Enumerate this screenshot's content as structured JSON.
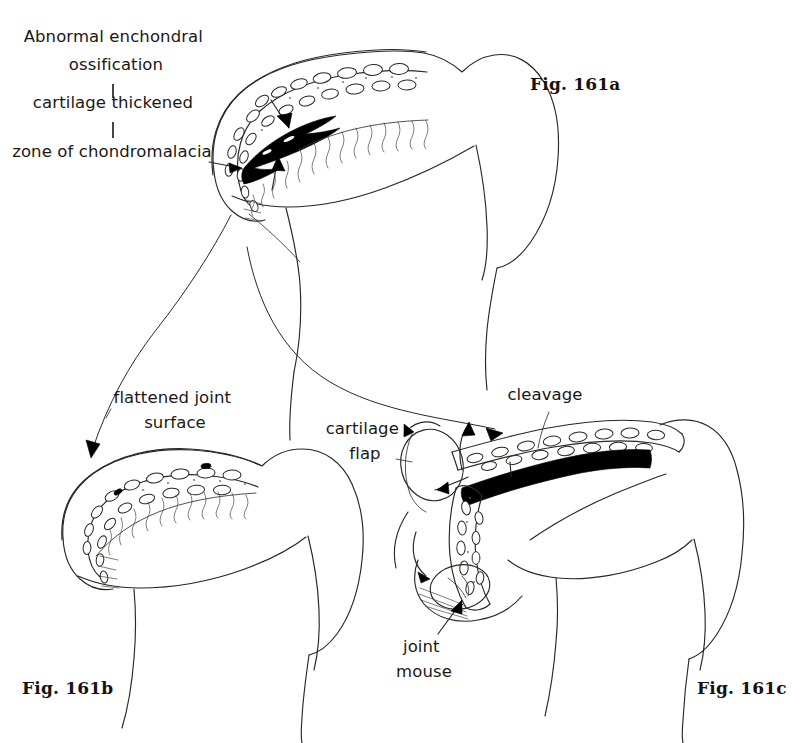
{
  "document": {
    "kind": "medical-illustration",
    "subject": "Osteochondritis dissecans / chondromalacia of the femoral head",
    "background_color": "#ffffff",
    "ink_color": "#2b2621",
    "necrosis_color": "#000000"
  },
  "figures": [
    {
      "id": "fig-161a",
      "caption": "Fig. 161a",
      "caption_x": 530,
      "caption_y": 90
    },
    {
      "id": "fig-161b",
      "caption": "Fig. 161b",
      "caption_x": 22,
      "caption_y": 694
    },
    {
      "id": "fig-161c",
      "caption": "Fig. 161c",
      "caption_x": 697,
      "caption_y": 694
    }
  ],
  "annotations": [
    {
      "id": "abnormal-enchondral-ossification",
      "lines": [
        "Abnormal enchondral",
        "ossification"
      ],
      "anchor_x": 116,
      "anchor_y": 42,
      "align": "middle"
    },
    {
      "id": "cartilage-thickened",
      "lines": [
        "cartilage thickened"
      ],
      "anchor_x": 113,
      "anchor_y": 108,
      "align": "middle"
    },
    {
      "id": "zone-of-chondromalacia",
      "lines": [
        "zone of chondromalacia"
      ],
      "anchor_x": 112,
      "anchor_y": 157,
      "align": "middle"
    },
    {
      "id": "flattened-joint-surface",
      "lines": [
        "flattened joint",
        "surface"
      ],
      "anchor_x": 175,
      "anchor_y": 403,
      "align": "middle"
    },
    {
      "id": "cartilage-flap",
      "lines": [
        "cartilage",
        "flap"
      ],
      "anchor_x": 365,
      "anchor_y": 434,
      "align": "middle"
    },
    {
      "id": "cleavage",
      "lines": [
        "cleavage"
      ],
      "anchor_x": 545,
      "anchor_y": 400,
      "align": "middle"
    },
    {
      "id": "joint-mouse",
      "lines": [
        "joint",
        "mouse"
      ],
      "anchor_x": 424,
      "anchor_y": 652,
      "align": "middle"
    }
  ],
  "connectors": {
    "label_stack_ticks": [
      {
        "id": "tick-ossification-to-cartilage",
        "x": 113,
        "y1": 84,
        "y2": 98
      },
      {
        "id": "tick-cartilage-to-zone",
        "x": 113,
        "y1": 122,
        "y2": 138
      }
    ]
  }
}
